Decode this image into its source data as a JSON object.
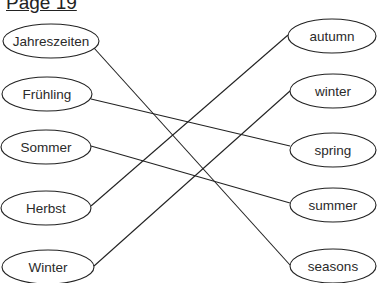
{
  "page": {
    "title": "Page 19"
  },
  "left_items": [
    {
      "label": "Jahreszeiten",
      "cx": 51,
      "cy": 41,
      "rx": 48,
      "ry": 17
    },
    {
      "label": "Frühling",
      "cx": 47,
      "cy": 94,
      "rx": 45,
      "ry": 17
    },
    {
      "label": "Sommer",
      "cx": 46,
      "cy": 147,
      "rx": 45,
      "ry": 17
    },
    {
      "label": "Herbst",
      "cx": 46,
      "cy": 208,
      "rx": 45,
      "ry": 17
    },
    {
      "label": "Winter",
      "cx": 48,
      "cy": 267,
      "rx": 46,
      "ry": 17
    }
  ],
  "right_items": [
    {
      "label": "autumn",
      "cx": 332,
      "cy": 36,
      "rx": 44,
      "ry": 17
    },
    {
      "label": "winter",
      "cx": 333,
      "cy": 91,
      "rx": 43,
      "ry": 17
    },
    {
      "label": "spring",
      "cx": 333,
      "cy": 150,
      "rx": 43,
      "ry": 17
    },
    {
      "label": "summer",
      "cx": 333,
      "cy": 205,
      "rx": 43,
      "ry": 17
    },
    {
      "label": "seasons",
      "cx": 333,
      "cy": 266,
      "rx": 43,
      "ry": 17
    }
  ],
  "connections": [
    {
      "from": "Jahreszeiten",
      "to": "seasons",
      "x1": 94,
      "y1": 48,
      "x2": 290,
      "y2": 265
    },
    {
      "from": "Frühling",
      "to": "spring",
      "x1": 91,
      "y1": 99,
      "x2": 290,
      "y2": 146
    },
    {
      "from": "Sommer",
      "to": "summer",
      "x1": 91,
      "y1": 146,
      "x2": 290,
      "y2": 203
    },
    {
      "from": "Herbst",
      "to": "autumn",
      "x1": 91,
      "y1": 206,
      "x2": 288,
      "y2": 35
    },
    {
      "from": "Winter",
      "to": "winter",
      "x1": 94,
      "y1": 266,
      "x2": 290,
      "y2": 91
    }
  ],
  "colors": {
    "stroke": "#222222",
    "background": "#ffffff"
  }
}
